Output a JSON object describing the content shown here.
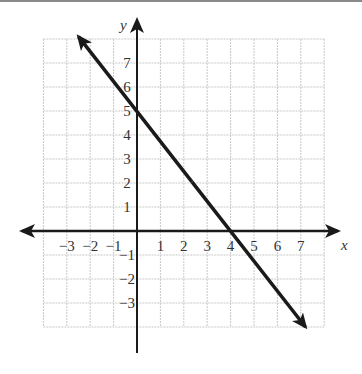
{
  "chart_data": {
    "type": "line",
    "title": "",
    "xlabel": "x",
    "ylabel": "y",
    "xlim": [
      -4,
      8
    ],
    "ylim": [
      -4,
      8
    ],
    "grid": true,
    "legend": null,
    "x_tick_labels": [
      "-3",
      "-2",
      "-1",
      "1",
      "2",
      "3",
      "4",
      "5",
      "6",
      "7"
    ],
    "y_tick_labels": [
      "7",
      "6",
      "5",
      "4",
      "3",
      "2",
      "1",
      "-1",
      "-2",
      "-3"
    ],
    "series": [
      {
        "name": "line",
        "equation": "y = -5/4 x + 5",
        "slope": -1.25,
        "y_intercept": 5,
        "x_intercept": 4,
        "x": [
          -2.5,
          0,
          4,
          7.2
        ],
        "y": [
          8.1,
          5,
          0,
          -4
        ],
        "arrows_both_ends": true
      }
    ]
  },
  "labels": {
    "x_axis": "x",
    "y_axis": "y",
    "x_ticks": [
      {
        "v": -3,
        "t": "−3"
      },
      {
        "v": -2,
        "t": "−2"
      },
      {
        "v": -1,
        "t": "−1"
      },
      {
        "v": 1,
        "t": "1"
      },
      {
        "v": 2,
        "t": "2"
      },
      {
        "v": 3,
        "t": "3"
      },
      {
        "v": 4,
        "t": "4"
      },
      {
        "v": 5,
        "t": "5"
      },
      {
        "v": 6,
        "t": "6"
      },
      {
        "v": 7,
        "t": "7"
      }
    ],
    "y_ticks": [
      {
        "v": 7,
        "t": "7"
      },
      {
        "v": 6,
        "t": "6"
      },
      {
        "v": 5,
        "t": "5"
      },
      {
        "v": 4,
        "t": "4"
      },
      {
        "v": 3,
        "t": "3"
      },
      {
        "v": 2,
        "t": "2"
      },
      {
        "v": 1,
        "t": "1"
      },
      {
        "v": -1,
        "t": "−1"
      },
      {
        "v": -2,
        "t": "−2"
      },
      {
        "v": -3,
        "t": "−3"
      }
    ]
  }
}
